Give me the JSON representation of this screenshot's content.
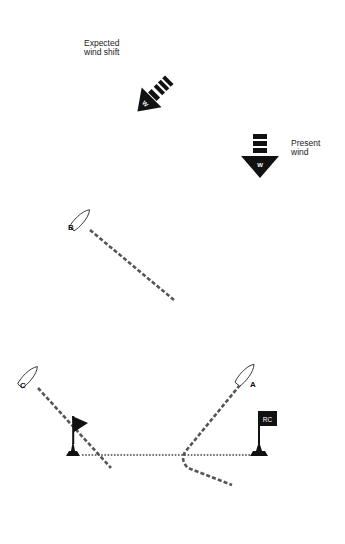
{
  "labels": {
    "expected_wind_shift": "Expected\nwind shift",
    "present_wind": "Present\nwind",
    "wind_arrow_glyph": "W",
    "committee_flag": "RC"
  },
  "boats": [
    {
      "id": "A",
      "label": "A"
    },
    {
      "id": "B",
      "label": "B"
    },
    {
      "id": "C",
      "label": "C"
    }
  ],
  "marks": {
    "pin_end": "flag mark",
    "committee_boat": "RC"
  },
  "colors": {
    "ink": "#111111",
    "track": "#555555",
    "background": "#ffffff"
  }
}
